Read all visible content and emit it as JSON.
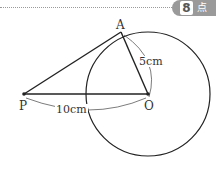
{
  "header": {
    "badge_number": "8",
    "badge_unit": "点"
  },
  "diagram": {
    "points": {
      "A": {
        "label": "A",
        "x": 121,
        "y": 32
      },
      "O": {
        "label": "O",
        "x": 148,
        "y": 94
      },
      "P": {
        "label": "P",
        "x": 24,
        "y": 94
      }
    },
    "circle": {
      "center": "O",
      "radius": 62
    },
    "segments": [
      "PA",
      "AO",
      "PO"
    ],
    "measurements": {
      "AO": "5cm",
      "PO": "10cm"
    }
  }
}
